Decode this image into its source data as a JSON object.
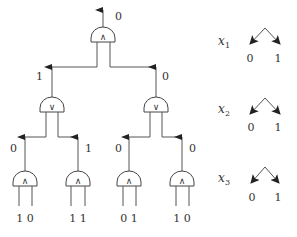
{
  "circuit": {
    "root": {
      "type": "AND",
      "symbol": "∧",
      "output": "0"
    },
    "level2": [
      {
        "type": "OR",
        "symbol": "∨",
        "output": "1"
      },
      {
        "type": "OR",
        "symbol": "∨",
        "output": "0"
      }
    ],
    "leaves": [
      {
        "type": "AND",
        "symbol": "∧",
        "output": "0",
        "inputs": "1 0"
      },
      {
        "type": "AND",
        "symbol": "∧",
        "output": "1",
        "inputs": "1 1"
      },
      {
        "type": "AND",
        "symbol": "∧",
        "output": "0",
        "inputs": "0 1"
      },
      {
        "type": "AND",
        "symbol": "∧",
        "output": "0",
        "inputs": "1 0"
      }
    ]
  },
  "legend": [
    {
      "var": "x",
      "sub": "1",
      "left": "0",
      "right": "1"
    },
    {
      "var": "x",
      "sub": "2",
      "left": "0",
      "right": "1"
    },
    {
      "var": "x",
      "sub": "3",
      "left": "0",
      "right": "1"
    }
  ]
}
